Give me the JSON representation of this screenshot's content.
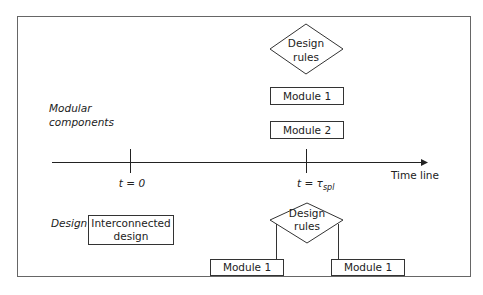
{
  "diagram": {
    "labels": {
      "modular_components_line1": "Modular",
      "modular_components_line2": "components",
      "design": "Design",
      "time_line": "Time line",
      "t0": "t = 0",
      "tspl_prefix": "t = τ",
      "tspl_sub": "spl"
    },
    "top": {
      "design_rules_line1": "Design",
      "design_rules_line2": "rules",
      "module1": "Module 1",
      "module2": "Module 2"
    },
    "bottom": {
      "interconnected_line1": "Interconnected",
      "interconnected_line2": "design",
      "design_rules_line1": "Design",
      "design_rules_line2": "rules",
      "module_left": "Module 1",
      "module_right": "Module 1"
    }
  }
}
